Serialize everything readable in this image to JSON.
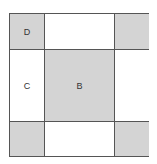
{
  "diagram": {
    "type": "3x3 grid",
    "colors": {
      "shaded": "#d4d4d4",
      "unshaded": "#ffffff",
      "border": "#555555"
    },
    "cells": [
      {
        "row": 0,
        "col": 0,
        "shade": "gray",
        "label": "D"
      },
      {
        "row": 0,
        "col": 1,
        "shade": "white",
        "label": ""
      },
      {
        "row": 0,
        "col": 2,
        "shade": "gray",
        "label": ""
      },
      {
        "row": 1,
        "col": 0,
        "shade": "white",
        "label": "C"
      },
      {
        "row": 1,
        "col": 1,
        "shade": "gray",
        "label": "B"
      },
      {
        "row": 1,
        "col": 2,
        "shade": "white",
        "label": ""
      },
      {
        "row": 2,
        "col": 0,
        "shade": "gray",
        "label": ""
      },
      {
        "row": 2,
        "col": 1,
        "shade": "white",
        "label": ""
      },
      {
        "row": 2,
        "col": 2,
        "shade": "gray",
        "label": ""
      }
    ]
  }
}
